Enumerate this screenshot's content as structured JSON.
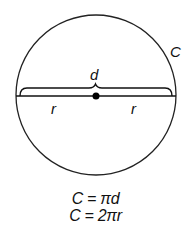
{
  "diagram": {
    "type": "circle-geometry",
    "circle": {
      "cx": 96,
      "cy": 95,
      "r": 80,
      "stroke": "#222222"
    },
    "labels": {
      "circumference": "C",
      "diameter": "d",
      "radius_left": "r",
      "radius_right": "r"
    },
    "formulas": [
      "C = πd",
      "C = 2πr"
    ]
  }
}
